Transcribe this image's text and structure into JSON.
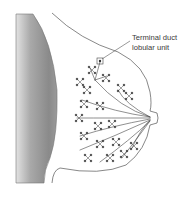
{
  "figure": {
    "type": "anatomical-diagram",
    "annotations": [
      {
        "id": "tdlu",
        "line1": "Terminal duct",
        "line2": "lobular unit"
      }
    ]
  },
  "colors": {
    "outline": "#555555",
    "duct": "#444444",
    "chest_wall_dark": "#7a7a7a",
    "chest_wall_light": "#d8d8d8",
    "text": "#3a3a3a"
  }
}
